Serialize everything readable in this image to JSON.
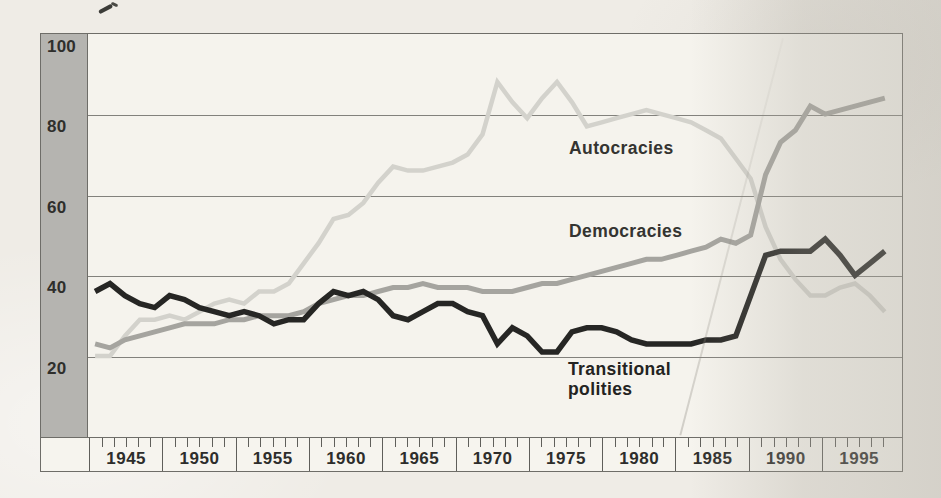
{
  "figure": {
    "background_color": "#efece6",
    "plot_background_color": "#f5f3ed",
    "axis_band_color": "#b5b4b0",
    "grid_color": "#82817c",
    "frame_color": "#6e6d68",
    "text_color": "#2d2d2b"
  },
  "y_axis": {
    "labels": [
      "100",
      "80",
      "60",
      "40",
      "20"
    ]
  },
  "x_axis": {
    "labels": [
      "1945",
      "1950",
      "1955",
      "1960",
      "1965",
      "1970",
      "1975",
      "1980",
      "1985",
      "1990",
      "1995"
    ],
    "minor_ticks_per_cell": 5
  },
  "series_labels": {
    "autocracies": "Autocracies",
    "democracies": "Democracies",
    "transitional": "Transitional\npolities"
  },
  "chart_data": {
    "type": "line",
    "title": "",
    "xlabel": "",
    "ylabel": "",
    "x": [
      1944,
      1945,
      1946,
      1947,
      1948,
      1949,
      1950,
      1951,
      1952,
      1953,
      1954,
      1955,
      1956,
      1957,
      1958,
      1959,
      1960,
      1961,
      1962,
      1963,
      1964,
      1965,
      1966,
      1967,
      1968,
      1969,
      1970,
      1971,
      1972,
      1973,
      1974,
      1975,
      1976,
      1977,
      1978,
      1979,
      1980,
      1981,
      1982,
      1983,
      1984,
      1985,
      1986,
      1987,
      1988,
      1989,
      1990,
      1991,
      1992,
      1993,
      1994,
      1995,
      1996,
      1997
    ],
    "series": [
      {
        "name": "Autocracies",
        "color": "#d3d2cc",
        "values": [
          20,
          20,
          25,
          29,
          29,
          30,
          29,
          31,
          33,
          34,
          33,
          36,
          36,
          38,
          43,
          48,
          54,
          55,
          58,
          63,
          67,
          66,
          66,
          67,
          68,
          70,
          75,
          88,
          83,
          79,
          84,
          88,
          83,
          77,
          78,
          79,
          80,
          81,
          80,
          79,
          78,
          76,
          74,
          69,
          64,
          52,
          44,
          39,
          35,
          35,
          37,
          38,
          35,
          31
        ]
      },
      {
        "name": "Democracies",
        "color": "#a5a49f",
        "values": [
          23,
          22,
          24,
          25,
          26,
          27,
          28,
          28,
          28,
          29,
          29,
          30,
          30,
          30,
          31,
          33,
          34,
          35,
          35,
          36,
          37,
          37,
          38,
          37,
          37,
          37,
          36,
          36,
          36,
          37,
          38,
          38,
          39,
          40,
          41,
          42,
          43,
          44,
          44,
          45,
          46,
          47,
          49,
          48,
          50,
          65,
          73,
          76,
          82,
          80,
          81,
          82,
          83,
          84
        ]
      },
      {
        "name": "Transitional polities",
        "color": "#262624",
        "values": [
          36,
          38,
          35,
          33,
          32,
          35,
          34,
          32,
          31,
          30,
          31,
          30,
          28,
          29,
          29,
          33,
          36,
          35,
          36,
          34,
          30,
          29,
          31,
          33,
          33,
          31,
          30,
          23,
          27,
          25,
          21,
          21,
          26,
          27,
          27,
          26,
          24,
          23,
          23,
          23,
          23,
          24,
          24,
          25,
          35,
          45,
          46,
          46,
          46,
          49,
          45,
          40,
          43,
          46
        ]
      }
    ],
    "ylim": [
      0,
      100
    ],
    "yticks": [
      20,
      40,
      60,
      80,
      100
    ],
    "xticks": [
      1945,
      1950,
      1955,
      1960,
      1965,
      1970,
      1975,
      1980,
      1985,
      1990,
      1995
    ],
    "grid": "horizontal",
    "legend_position": "inline-annotations",
    "annotations": [
      {
        "text": "Autocracies",
        "x": 1976,
        "y": 72
      },
      {
        "text": "Democracies",
        "x": 1976,
        "y": 51
      },
      {
        "text": "Transitional\npolities",
        "x": 1975,
        "y": 14
      }
    ]
  }
}
